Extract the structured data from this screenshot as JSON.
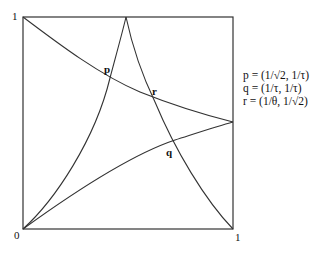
{
  "diagram": {
    "axis_labels": {
      "top_left": "1",
      "bottom_left": "0",
      "bottom_right": "1"
    },
    "points": [
      {
        "name": "p",
        "label": "p"
      },
      {
        "name": "q",
        "label": "q"
      },
      {
        "name": "r",
        "label": "r"
      }
    ],
    "legend": [
      "p = (1/√2, 1/τ)",
      "q = (1/τ, 1/τ)",
      "r = (1/θ, 1/√2)"
    ],
    "line_color": "#333333"
  }
}
